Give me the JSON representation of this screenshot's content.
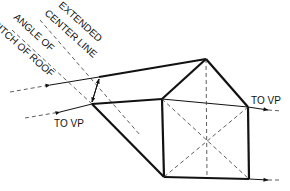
{
  "diagram": {
    "type": "perspective-roof-construction",
    "labels": {
      "extended_center_line_1": "EXTENDED",
      "extended_center_line_2": "CENTER LINE",
      "angle_of_roof_1": "ANGLE OF",
      "angle_of_roof_2": "PITCH OF ROOF",
      "to_vp_left": "TO VP",
      "to_vp_right": "TO VP"
    },
    "colors": {
      "line": "#111111",
      "background": "#ffffff"
    }
  }
}
